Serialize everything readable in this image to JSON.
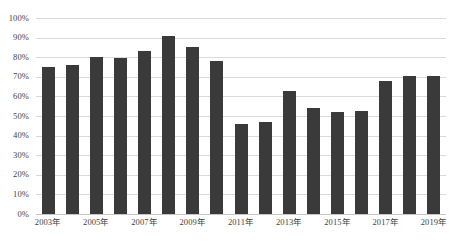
{
  "chart_data": {
    "type": "bar",
    "title": "",
    "subtitle": "",
    "xlabel": "",
    "ylabel": "",
    "ylim": [
      0,
      100
    ],
    "grid": true,
    "legend": false,
    "legend_position": "none",
    "y_tick_labels": [
      "100%",
      "90%",
      "80%",
      "70%",
      "60%",
      "50%",
      "40%",
      "30%",
      "20%",
      "10%",
      "0%"
    ],
    "y_tick_values": [
      100,
      90,
      80,
      70,
      60,
      50,
      40,
      30,
      20,
      10,
      0
    ],
    "categories": [
      "2003年",
      "2004年",
      "2005年",
      "2006年",
      "2007年",
      "2008年",
      "2009年",
      "2010年",
      "2011年",
      "2012年",
      "2013年",
      "2014年",
      "2015年",
      "2016年",
      "2017年",
      "2018年",
      "2019年"
    ],
    "x_tick_labels": [
      "2003年",
      "2005年",
      "2007年",
      "2009年",
      "2011年",
      "2013年",
      "2015年",
      "2017年",
      "2019年"
    ],
    "x_tick_category_indices": [
      0,
      2,
      4,
      6,
      8,
      10,
      12,
      14,
      16
    ],
    "values": [
      75,
      76,
      80,
      79.5,
      83,
      91,
      85,
      78,
      46,
      47,
      63,
      54,
      52,
      52.5,
      68,
      70.5,
      70.5
    ],
    "bar_color": "#3a3a3a",
    "gridline_color": "#d9d9d9",
    "background_color": "#ffffff",
    "axis_text_color": "#3f3f3f"
  }
}
